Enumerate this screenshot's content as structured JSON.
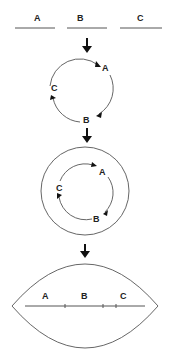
{
  "diagram": {
    "stage1": {
      "labels": [
        "A",
        "B",
        "C"
      ],
      "description": "three separate linear segments"
    },
    "stage2": {
      "labels": [
        "A",
        "B",
        "C"
      ],
      "description": "segments joined into a circular arrangement with arrows A to B to C"
    },
    "stage3": {
      "labels": [
        "A",
        "B",
        "C"
      ],
      "description": "circular arrangement enclosed in an outer circle"
    },
    "stage4": {
      "labels": [
        "A",
        "B",
        "C"
      ],
      "description": "lens-shaped enclosure containing a single linear segment with A, B, C"
    },
    "colors": {
      "line": "#555555",
      "arrow": "#111111",
      "text": "#222222"
    }
  }
}
